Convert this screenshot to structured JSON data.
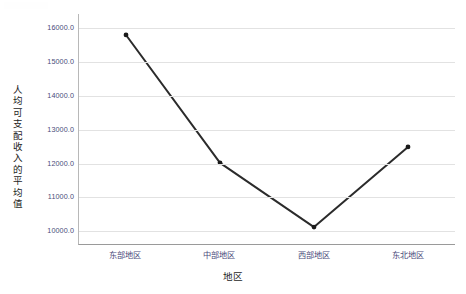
{
  "chart_data": {
    "type": "line",
    "title": "",
    "xlabel": "地区",
    "ylabel": "人均可支配收入的平均值",
    "categories": [
      "东部地区",
      "中部地区",
      "西部地区",
      "东北地区"
    ],
    "values": [
      15780.0,
      12000.0,
      10100.0,
      12470.0
    ],
    "series": [
      {
        "name": "人均可支配收入的平均值",
        "values": [
          15780.0,
          12000.0,
          10100.0,
          12470.0
        ]
      }
    ],
    "ylim": [
      9600.0,
      16400.0
    ],
    "ytick_labels": [
      "16000.0",
      "15000.0",
      "14000.0",
      "13000.0",
      "12000.0",
      "11000.0",
      "10000.0"
    ],
    "ytick_values": [
      16000.0,
      15000.0,
      14000.0,
      13000.0,
      12000.0,
      11000.0,
      10000.0
    ],
    "grid": true,
    "legend": "none",
    "line_color": "#2b2b2b",
    "marker_color": "#1a1a1a",
    "marker": "circle",
    "grid_color": "#e2e2e2",
    "tick_label_color": "#4a4a7a",
    "axis_title_color": "#1d1d1d"
  }
}
